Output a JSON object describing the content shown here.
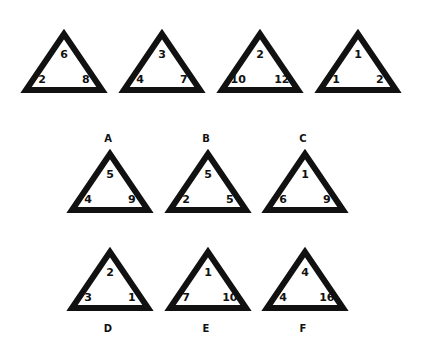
{
  "puzzle": {
    "sequence": [
      {
        "top": "6",
        "left": "2",
        "right": "8"
      },
      {
        "top": "3",
        "left": "4",
        "right": "7"
      },
      {
        "top": "2",
        "left": "10",
        "right": "12"
      },
      {
        "top": "1",
        "left": "1",
        "right": "2"
      }
    ],
    "options": [
      {
        "label": "A",
        "top": "5",
        "left": "4",
        "right": "9"
      },
      {
        "label": "B",
        "top": "5",
        "left": "2",
        "right": "5"
      },
      {
        "label": "C",
        "top": "1",
        "left": "6",
        "right": "9"
      },
      {
        "label": "D",
        "top": "2",
        "left": "3",
        "right": "1"
      },
      {
        "label": "E",
        "top": "1",
        "left": "7",
        "right": "10"
      },
      {
        "label": "F",
        "top": "4",
        "left": "4",
        "right": "16"
      }
    ]
  },
  "colors": {
    "stroke": "#111111",
    "background": "#ffffff"
  }
}
